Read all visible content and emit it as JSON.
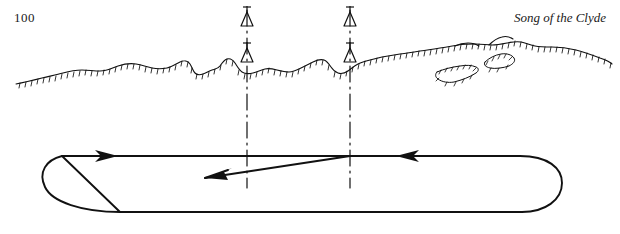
{
  "page": {
    "number": "100",
    "running_head": "Song of the Clyde",
    "width": 620,
    "height": 234,
    "background_color": "#ffffff",
    "ink_color": "#111111"
  },
  "figure": {
    "caption": "",
    "elements": [
      {
        "name": "coastline",
        "type": "hatched-shore-line",
        "label": ""
      },
      {
        "name": "islet-left",
        "type": "small-hatched-island",
        "label": ""
      },
      {
        "name": "islet-right",
        "type": "small-hatched-island",
        "label": ""
      },
      {
        "name": "range-line-left",
        "type": "dash-dot-vertical-line",
        "x": 247,
        "label": ""
      },
      {
        "name": "range-line-right",
        "type": "dash-dot-vertical-line",
        "x": 350,
        "label": ""
      },
      {
        "name": "beacon-left-upper",
        "type": "triangle-with-mast",
        "label": ""
      },
      {
        "name": "beacon-left-lower",
        "type": "triangle-with-mast",
        "label": ""
      },
      {
        "name": "beacon-right-upper",
        "type": "triangle-with-mast",
        "label": ""
      },
      {
        "name": "beacon-right-lower",
        "type": "triangle-with-mast",
        "label": ""
      },
      {
        "name": "track-loop",
        "type": "closed-track-line",
        "label": ""
      },
      {
        "name": "arrow-top-left",
        "type": "direction-arrow",
        "direction": "right",
        "label": ""
      },
      {
        "name": "arrow-mid-left",
        "type": "direction-arrow",
        "direction": "left-down",
        "label": ""
      },
      {
        "name": "arrow-right",
        "type": "direction-arrow",
        "direction": "left",
        "label": ""
      }
    ]
  }
}
